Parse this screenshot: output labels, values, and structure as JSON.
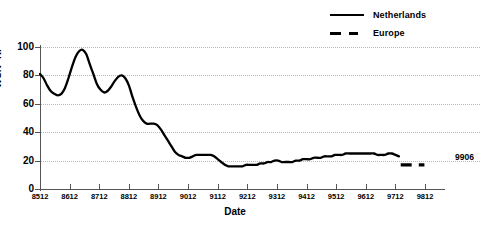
{
  "chart_data": {
    "type": "line",
    "title": "",
    "xlabel": "Date",
    "ylabel": "WCR--RF",
    "xlim": [
      8512,
      9812
    ],
    "ylim": [
      0,
      100
    ],
    "grid": true,
    "legend_position": "top-right",
    "categories": [
      "8512",
      "8612",
      "8712",
      "8812",
      "8912",
      "9012",
      "9112",
      "9212",
      "9312",
      "9412",
      "9512",
      "9612",
      "9712",
      "9812"
    ],
    "tick_labels_x": [
      "8512",
      "8612",
      "8712",
      "8812",
      "8912",
      "9012",
      "9112",
      "9212",
      "9312",
      "9412",
      "9512",
      "9612",
      "9712",
      "9812"
    ],
    "tick_labels_y": [
      "0",
      "20",
      "40",
      "60",
      "80",
      "100"
    ],
    "tick_values_y": [
      0,
      20,
      40,
      60,
      80,
      100
    ],
    "annotations": [
      {
        "text": "9906",
        "x": 9906,
        "y": 22
      }
    ],
    "series": [
      {
        "name": "Netherlands",
        "style": "solid",
        "color": "#000000",
        "x": [
          8512,
          8524,
          8536,
          8548,
          8560,
          8572,
          8584,
          8596,
          8608,
          8620,
          8632,
          8644,
          8656,
          8668,
          8680,
          8692,
          8704,
          8716,
          8728,
          8740,
          8752,
          8764,
          8776,
          8788,
          8800,
          8812,
          8824,
          8836,
          8848,
          8860,
          8872,
          8884,
          8896,
          8908,
          8920,
          8932,
          8944,
          8956,
          8968,
          8980,
          8992,
          9004,
          9016,
          9028,
          9040,
          9052,
          9064,
          9076,
          9088,
          9100,
          9112,
          9124,
          9136,
          9148,
          9160,
          9172,
          9184,
          9196,
          9208,
          9220,
          9232,
          9244,
          9256,
          9268,
          9280,
          9292,
          9304,
          9316,
          9328,
          9340,
          9352,
          9364,
          9376,
          9388,
          9400,
          9412,
          9424,
          9436,
          9448,
          9460,
          9472,
          9484,
          9496,
          9508,
          9520,
          9532,
          9544,
          9556,
          9568,
          9580,
          9592,
          9604,
          9616,
          9628,
          9640,
          9652,
          9664,
          9676,
          9688,
          9700,
          9712,
          9724
        ],
        "values": [
          81,
          78,
          73,
          69,
          67,
          66,
          67,
          71,
          78,
          86,
          93,
          97,
          98,
          95,
          88,
          81,
          74,
          70,
          68,
          69,
          72,
          76,
          79,
          80,
          78,
          73,
          65,
          58,
          52,
          48,
          46,
          46,
          46,
          45,
          42,
          38,
          34,
          30,
          26,
          24,
          23,
          22,
          22,
          23,
          24,
          24,
          24,
          24,
          24,
          23,
          21,
          19,
          17,
          16,
          16,
          16,
          16,
          16,
          17,
          17,
          17,
          17,
          18,
          18,
          19,
          19,
          20,
          20,
          19,
          19,
          19,
          19,
          20,
          20,
          21,
          21,
          21,
          22,
          22,
          22,
          23,
          23,
          23,
          24,
          24,
          24,
          25,
          25,
          25,
          25,
          25,
          25,
          25,
          25,
          25,
          24,
          24,
          24,
          25,
          25,
          24,
          23
        ]
      },
      {
        "name": "Europe",
        "style": "dashed",
        "color": "#000000",
        "x": [
          9730,
          9810
        ],
        "values": [
          17,
          17
        ]
      }
    ]
  },
  "legend": {
    "items": [
      {
        "label": "Netherlands",
        "style": "solid"
      },
      {
        "label": "Europe",
        "style": "dashed"
      }
    ]
  },
  "axes": {
    "x_title": "Date",
    "y_title": "WCR--RF"
  }
}
